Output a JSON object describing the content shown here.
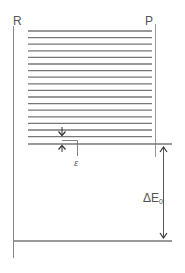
{
  "diagram": {
    "labels": {
      "reactant": "R",
      "product": "P",
      "spacing": "ε",
      "energy_gap_prefix": "ΔE",
      "energy_gap_subscript": "0"
    },
    "colors": {
      "line": "#777777",
      "text": "#555555",
      "background": "#ffffff"
    },
    "levels": {
      "count": 18,
      "first_y": 31,
      "spacing": 6.6,
      "x_start": 28,
      "x_end": 152
    }
  }
}
